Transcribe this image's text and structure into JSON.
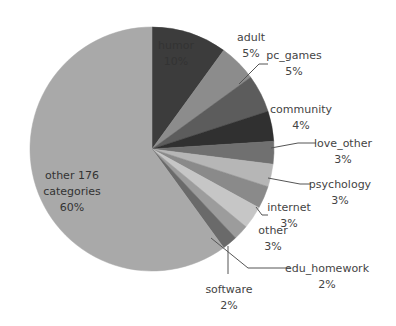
{
  "chart_data": {
    "type": "pie",
    "title": "",
    "start_angle_deg": 0,
    "direction": "clockwise",
    "slices": [
      {
        "label": "humor",
        "value": 10,
        "pct_label": "10%",
        "color": "#3c3c3c"
      },
      {
        "label": "adult",
        "value": 5,
        "pct_label": "5%",
        "color": "#8c8c8c"
      },
      {
        "label": "pc_games",
        "value": 5,
        "pct_label": "5%",
        "color": "#5c5c5c"
      },
      {
        "label": "community",
        "value": 4,
        "pct_label": "4%",
        "color": "#303030"
      },
      {
        "label": "love_other",
        "value": 3,
        "pct_label": "3%",
        "color": "#707070"
      },
      {
        "label": "psychology",
        "value": 3,
        "pct_label": "3%",
        "color": "#b6b6b6"
      },
      {
        "label": "internet",
        "value": 3,
        "pct_label": "3%",
        "color": "#8a8a8a"
      },
      {
        "label": "other",
        "value": 3,
        "pct_label": "3%",
        "color": "#c6c6c6"
      },
      {
        "label": "edu_homework",
        "value": 2,
        "pct_label": "2%",
        "color": "#9c9c9c"
      },
      {
        "label": "software",
        "value": 2,
        "pct_label": "2%",
        "color": "#6a6a6a"
      },
      {
        "label": "other 176 categories",
        "value": 60,
        "pct_label": "60%",
        "color": "#a9a9a9"
      }
    ]
  },
  "labels": [
    {
      "name": "humor",
      "line1": "humor",
      "line2": "10%",
      "x": 176,
      "y": 38,
      "inside": true
    },
    {
      "name": "adult",
      "line1": "adult",
      "line2": "5%",
      "x": 251,
      "y": 30,
      "inside": false
    },
    {
      "name": "pc_games",
      "line1": "pc_games",
      "line2": "5%",
      "x": 294,
      "y": 48,
      "inside": false
    },
    {
      "name": "community",
      "line1": "community",
      "line2": "4%",
      "x": 301,
      "y": 102,
      "inside": false
    },
    {
      "name": "love_other",
      "line1": "love_other",
      "line2": "3%",
      "x": 343,
      "y": 136,
      "inside": false
    },
    {
      "name": "psychology",
      "line1": "psychology",
      "line2": "3%",
      "x": 340,
      "y": 177,
      "inside": false
    },
    {
      "name": "internet",
      "line1": "internet",
      "line2": "3%",
      "x": 289,
      "y": 200,
      "inside": false
    },
    {
      "name": "other",
      "line1": "other",
      "line2": "3%",
      "x": 273,
      "y": 223,
      "inside": false
    },
    {
      "name": "edu_homework",
      "line1": "edu_homework",
      "line2": "2%",
      "x": 327,
      "y": 261,
      "inside": false
    },
    {
      "name": "software",
      "line1": "software",
      "line2": "2%",
      "x": 229,
      "y": 282,
      "inside": false
    },
    {
      "name": "other-176-categories",
      "line1": "other 176",
      "line2": "categories",
      "line3": "60%",
      "x": 72,
      "y": 168,
      "inside": true
    }
  ]
}
